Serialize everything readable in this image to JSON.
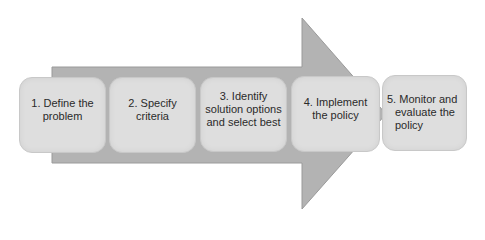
{
  "diagram": {
    "type": "process-arrow",
    "arrow_color": "#b3b3b3",
    "arrow_edge_color": "#9a9a9a",
    "box_color": "#dedede",
    "steps": [
      {
        "label": "1. Define the problem"
      },
      {
        "label": "2. Specify criteria"
      },
      {
        "label": "3. Identify solution options and select best"
      },
      {
        "label": "4. Implement the policy"
      },
      {
        "label": "5. Monitor and evaluate the policy"
      }
    ]
  }
}
